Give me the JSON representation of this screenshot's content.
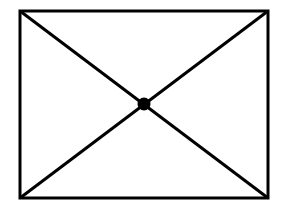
{
  "figure": {
    "name": "rectangle-with-diagonals",
    "canvas": {
      "width": 289,
      "height": 212,
      "background_color": "#ffffff"
    },
    "style": {
      "stroke_color": "#000000",
      "stroke_width": 3,
      "fill_color": "none",
      "node_fill_color": "#000000"
    },
    "rectangle": {
      "label": "outer-rectangle",
      "x": 20,
      "y": 11,
      "width": 248,
      "height": 187,
      "corners": {
        "top_left": [
          20,
          11
        ],
        "top_right": [
          268,
          11
        ],
        "bottom_right": [
          268,
          198
        ],
        "bottom_left": [
          20,
          198
        ]
      }
    },
    "diagonals": [
      {
        "label": "diagonal-top-left-to-bottom-right",
        "x1": 20,
        "y1": 11,
        "x2": 268,
        "y2": 198
      },
      {
        "label": "diagonal-top-right-to-bottom-left",
        "x1": 268,
        "y1": 11,
        "x2": 20,
        "y2": 198
      }
    ],
    "center_node": {
      "label": "center-intersection-node",
      "cx": 144,
      "cy": 104,
      "radius": 6.5,
      "shape": "filled-dot"
    }
  }
}
